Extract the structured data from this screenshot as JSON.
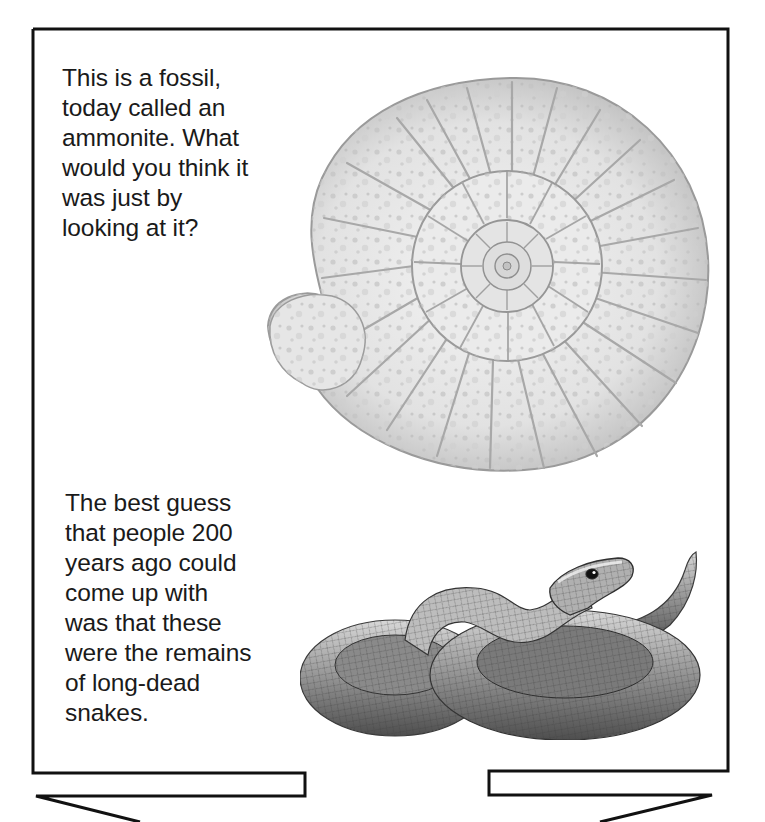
{
  "page": {
    "captions": {
      "ammonite": "This is a fossil,\ntoday called an\nammonite. What\nwould you think it\nwas just by\nlooking at it?",
      "snake": "The best guess\nthat people 200\nyears ago could\ncome up with\nwas that these\nwere the remains\nof long-dead\nsnakes."
    },
    "illustrations": [
      {
        "id": "ammonite-fossil",
        "subject": "ammonite fossil, coiled ribbed shell"
      },
      {
        "id": "coiled-snake",
        "subject": "coiled snake with raised head"
      }
    ],
    "colors": {
      "ink": "#1a1a1a",
      "border": "#111111",
      "paper": "#ffffff",
      "fossil_light": "#ececec",
      "fossil_mid": "#c8c8c8",
      "snake_dark": "#5a5a5a"
    }
  }
}
